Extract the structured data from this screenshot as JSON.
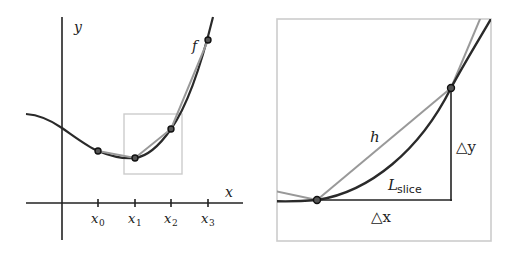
{
  "left_panel": {
    "axis_labels": {
      "x": "x",
      "y": "y"
    },
    "function_label": "f",
    "ticks": [
      {
        "base": "x",
        "sub": "0"
      },
      {
        "base": "x",
        "sub": "1"
      },
      {
        "base": "x",
        "sub": "2"
      },
      {
        "base": "x",
        "sub": "3"
      }
    ]
  },
  "right_panel": {
    "secant_label": "h",
    "slice_label": {
      "base": "L",
      "sub": "slice"
    },
    "delta_x": "△x",
    "delta_y": "△y"
  },
  "colors": {
    "curve": "#2a2a2a",
    "secant": "#999999",
    "box": "#cccccc",
    "axis": "#222222"
  }
}
